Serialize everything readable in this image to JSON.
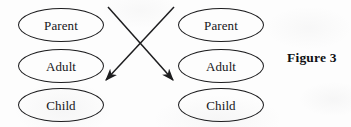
{
  "figure": {
    "caption": "Figure 3",
    "background_color": "#fdfdfd",
    "stroke_color": "#1d1d1f",
    "text_color": "#16161a"
  },
  "left_person": {
    "name": "left-person-column",
    "ego_states": [
      {
        "id": "parent",
        "label": "Parent",
        "x": 18,
        "y": 8,
        "width": 86,
        "height": 34
      },
      {
        "id": "adult",
        "label": "Adult",
        "x": 18,
        "y": 49,
        "width": 86,
        "height": 34
      },
      {
        "id": "child",
        "label": "Child",
        "x": 18,
        "y": 88,
        "width": 86,
        "height": 34
      }
    ]
  },
  "right_person": {
    "name": "right-person-column",
    "ego_states": [
      {
        "id": "parent",
        "label": "Parent",
        "x": 178,
        "y": 8,
        "width": 86,
        "height": 34
      },
      {
        "id": "adult",
        "label": "Adult",
        "x": 178,
        "y": 49,
        "width": 86,
        "height": 34
      },
      {
        "id": "child",
        "label": "Child",
        "x": 178,
        "y": 88,
        "width": 86,
        "height": 34
      }
    ]
  },
  "arrows": [
    {
      "id": "arrow-left-parent-to-right-child",
      "from": {
        "x": 108,
        "y": 7
      },
      "to": {
        "x": 173,
        "y": 80
      },
      "direction": "down-right",
      "arrowhead": "end"
    },
    {
      "id": "arrow-right-parent-to-left-child",
      "from": {
        "x": 174,
        "y": 7
      },
      "to": {
        "x": 106,
        "y": 80
      },
      "direction": "down-left",
      "arrowhead": "end"
    }
  ]
}
